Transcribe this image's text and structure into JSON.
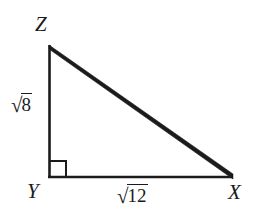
{
  "figure": {
    "kind": "right-triangle-diagram",
    "background_color": "#ffffff",
    "stroke_color": "#1b1b1b",
    "vertices": {
      "z": {
        "label": "Z",
        "x": 49,
        "y": 45
      },
      "y": {
        "label": "Y",
        "x": 49,
        "y": 177
      },
      "x": {
        "label": "X",
        "x": 233,
        "y": 177
      }
    },
    "right_angle": {
      "at_vertex": "Y",
      "marker": "square",
      "size": 16
    },
    "sides": [
      {
        "name": "leg-zy",
        "from": "Z",
        "to": "Y",
        "label_radix": "√",
        "label_radicand": "8",
        "label_text": "√8"
      },
      {
        "name": "leg-yx",
        "from": "Y",
        "to": "X",
        "label_radix": "√",
        "label_radicand": "12",
        "label_text": "√12"
      },
      {
        "name": "hypotenuse-zx",
        "from": "Z",
        "to": "X",
        "label_text": ""
      }
    ]
  }
}
